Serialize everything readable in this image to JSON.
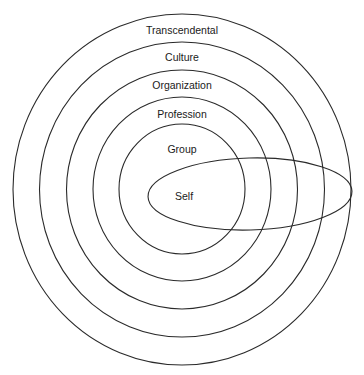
{
  "diagram": {
    "type": "nested-concentric-circles",
    "colors": {
      "background": "#ffffff",
      "stroke": "#2a2a2a",
      "text": "#1a1a1a"
    },
    "layers": [
      {
        "label": "Transcendental",
        "ring": {
          "cx": 182,
          "cy": 189.5,
          "rx": 169,
          "ry": 175.5
        },
        "label_pos": {
          "x": 182,
          "y": 31
        }
      },
      {
        "label": "Culture",
        "ring": {
          "cx": 182,
          "cy": 189.5,
          "rx": 142.5,
          "ry": 147.5
        },
        "label_pos": {
          "x": 182,
          "y": 58
        }
      },
      {
        "label": "Organization",
        "ring": {
          "cx": 182,
          "cy": 189.5,
          "rx": 115.5,
          "ry": 119.5
        },
        "label_pos": {
          "x": 182,
          "y": 86
        }
      },
      {
        "label": "Profession",
        "ring": {
          "cx": 182,
          "cy": 189,
          "rx": 89,
          "ry": 92
        },
        "label_pos": {
          "x": 182,
          "y": 115
        }
      },
      {
        "label": "Group",
        "ring": {
          "cx": 182,
          "cy": 189,
          "rx": 63,
          "ry": 65
        },
        "label_pos": {
          "x": 182,
          "y": 150
        }
      }
    ],
    "self": {
      "label": "Self",
      "ellipse": {
        "cx": 250,
        "cy": 194,
        "rx": 102,
        "ry": 36,
        "rotate": -1.5
      },
      "label_pos": {
        "x": 184,
        "y": 197
      }
    }
  }
}
